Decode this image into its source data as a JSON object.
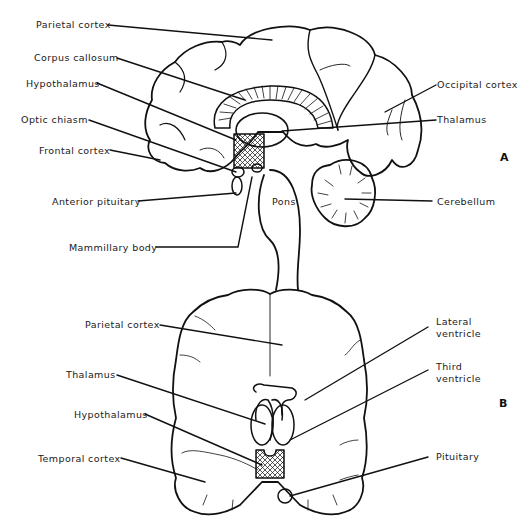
{
  "figure": {
    "panel_a": {
      "letter": "A",
      "view": "sagittal",
      "labels": {
        "parietal_cortex": "Parietal cortex",
        "corpus_callosum": "Corpus callosum",
        "hypothalamus": "Hypothalamus",
        "optic_chiasm": "Optic chiasm",
        "frontal_cortex": "Frontal cortex",
        "anterior_pituitary": "Anterior pituitary",
        "mammillary_body": "Mammillary body",
        "occipital_cortex": "Occipital cortex",
        "thalamus": "Thalamus",
        "pons": "Pons",
        "cerebellum": "Cerebellum"
      }
    },
    "panel_b": {
      "letter": "B",
      "view": "coronal",
      "labels": {
        "parietal_cortex": "Parietal cortex",
        "thalamus": "Thalamus",
        "hypothalamus": "Hypothalamus",
        "temporal_cortex": "Temporal cortex",
        "lateral_ventricle_1": "Lateral",
        "lateral_ventricle_2": "ventricle",
        "third_ventricle_1": "Third",
        "third_ventricle_2": "ventricle",
        "pituitary": "Pituitary"
      }
    },
    "colors": {
      "ink": "#111111",
      "background": "#ffffff"
    }
  }
}
